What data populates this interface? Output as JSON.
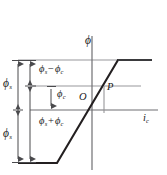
{
  "figure": {
    "kind": "saturation-curve-diagram",
    "axes": {
      "vertical_axis_label": "ϕ",
      "horizontal_axis_label": "i",
      "horizontal_axis_label_sub": "c",
      "origin_label": "O"
    },
    "points": [
      {
        "name": "operating-point",
        "label": "P"
      }
    ],
    "brackets": [
      {
        "name": "phi-s-upper",
        "symbol": "ϕ",
        "sub": "s"
      },
      {
        "name": "phi-s-lower",
        "symbol": "ϕ",
        "sub": "s"
      }
    ],
    "annotations": [
      {
        "name": "phi-s-minus-phi-c",
        "lhs": "ϕ",
        "lhs_sub": "s",
        "operator": "−",
        "rhs": "ϕ",
        "rhs_sub": "c"
      },
      {
        "name": "phi-c",
        "lhs": "ϕ",
        "lhs_sub": "c",
        "operator": "",
        "rhs": "",
        "rhs_sub": ""
      },
      {
        "name": "phi-s-plus-phi-c",
        "lhs": "ϕ",
        "lhs_sub": "s",
        "operator": "+",
        "rhs": "ϕ",
        "rhs_sub": "c"
      }
    ],
    "colors": {
      "curve": "#231f20",
      "axis": "#6f6f72",
      "gridline": "#8d8d90",
      "dimension": "#4a4a4d",
      "text": "#1a1a1a"
    }
  }
}
